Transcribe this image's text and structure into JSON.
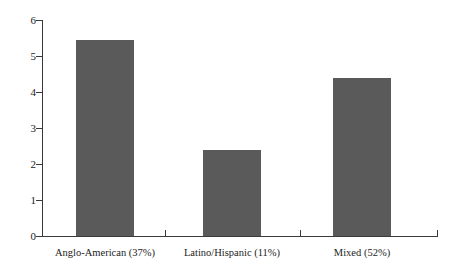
{
  "chart_data": {
    "type": "bar",
    "title": "",
    "subtitle": "",
    "xlabel": "",
    "ylabel": "",
    "categories": [
      "Anglo-American (37%)",
      "Latino/Hispanic (11%)",
      "Mixed (52%)"
    ],
    "values": [
      5.45,
      2.4,
      4.4
    ],
    "ylim": [
      0,
      6
    ],
    "ytick_labels": [
      "0",
      "1",
      "2",
      "3",
      "4",
      "5",
      "6"
    ],
    "ytick_values": [
      0,
      1,
      2,
      3,
      4,
      5,
      6
    ],
    "grid": false,
    "legend": "none",
    "bar_color": "#5a5a5a",
    "axis_color": "#3a3a3a",
    "background_color": "#ffffff"
  }
}
